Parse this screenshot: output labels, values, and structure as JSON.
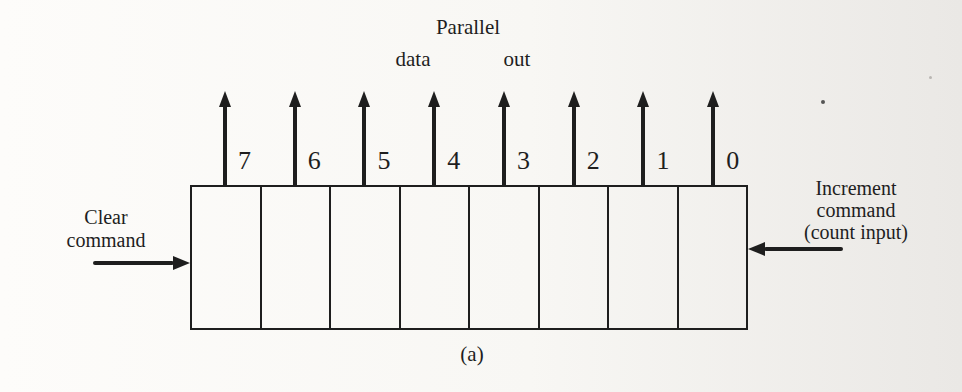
{
  "colors": {
    "ink": "#1e1e1e",
    "paper_left": "#fdfcfa",
    "paper_right": "#eae8e5"
  },
  "register": {
    "bits": [
      "7",
      "6",
      "5",
      "4",
      "3",
      "2",
      "1",
      "0"
    ]
  },
  "labels": {
    "parallel_line1": "Parallel",
    "parallel_line2a": "data",
    "parallel_line2b": "out",
    "clear_line1": "Clear",
    "clear_line2": "command",
    "increment_line1": "Increment",
    "increment_line2": "command",
    "increment_line3": "(count input)",
    "caption": "(a)"
  }
}
